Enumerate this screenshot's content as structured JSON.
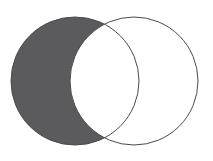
{
  "figure": {
    "kind": "venn-diagram",
    "width": 213,
    "height": 161,
    "background_color": "#ffffff"
  },
  "chart_data": {
    "type": "diagram",
    "subtype": "venn2",
    "title": "",
    "xlabel": "",
    "ylabel": "",
    "grid": false,
    "legend": "none",
    "canvas": {
      "width": 213,
      "height": 161
    },
    "sets": [
      {
        "name": "left-set",
        "label": "",
        "center_x": 75,
        "center_y": 81,
        "radius": 64,
        "fill": "#5b5b5d",
        "fill_state": "filled",
        "stroke": "#4a4a4c",
        "stroke_width": 1
      },
      {
        "name": "right-set",
        "label": "",
        "center_x": 134,
        "center_y": 81,
        "radius": 64,
        "fill": "#ffffff",
        "fill_state": "empty",
        "stroke": "#4a4a4c",
        "stroke_width": 1
      }
    ],
    "regions": [
      {
        "name": "left-only",
        "shaded": true,
        "fill": "#5b5b5d"
      },
      {
        "name": "intersection",
        "shaded": false,
        "fill": "#ffffff"
      },
      {
        "name": "right-only",
        "shaded": false,
        "fill": "#ffffff"
      }
    ],
    "intersection_points": [
      {
        "x": 106.5,
        "y": 19
      },
      {
        "x": 106.5,
        "y": 143
      }
    ],
    "annotations": [],
    "region_labels": []
  },
  "colors": {
    "shaded_fill": "#5b5b5d",
    "unshaded_fill": "#ffffff",
    "outline": "#4a4a4c",
    "background": "#ffffff"
  }
}
